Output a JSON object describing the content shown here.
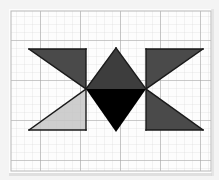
{
  "canvas": {
    "width": 219,
    "height": 180,
    "background_color": "#f7f7f7",
    "paper_color": "#fdfdfd",
    "description": "Geometric bowtie figure drawn on square grid paper"
  },
  "grid": {
    "name": "graph-paper-grid",
    "cell_size": 8,
    "major_every": 5,
    "minor_line_color": "#d8d8d8",
    "major_line_color": "#9a9a9a",
    "minor_line_width": 0.6,
    "major_line_width": 1.0,
    "origin_x": 11,
    "origin_y": 11,
    "cols": 25,
    "rows": 20,
    "border_color": "#c4c4c4"
  },
  "palette": {
    "dark_gray": "#4a4a4a",
    "light_gray": "#c6c6c6",
    "black": "#000000",
    "outline": "#1a1a1a",
    "shadow": "#2b2b2b"
  },
  "figure": {
    "name": "bowtie-star-figure",
    "outline_width": 1.4,
    "center_x": 116,
    "left_vertex_x": 86,
    "right_vertex_x": 146,
    "top_y": 49,
    "bottom_y": 130,
    "mid_y": 89,
    "apex_y": 48,
    "tip_y": 132,
    "left_outer_x": 29,
    "right_outer_x": 203,
    "shapes": [
      {
        "id": "upper-left-triangle",
        "label": "Upper left triangle",
        "fill": "#4a4a4a",
        "points": "29,49 86,49 86,89"
      },
      {
        "id": "lower-left-triangle",
        "label": "Lower left triangle",
        "fill": "#c6c6c6",
        "points": "29,130 86,130 86,89"
      },
      {
        "id": "upper-right-triangle",
        "label": "Upper right triangle",
        "fill": "#4a4a4a",
        "points": "203,49 146,49 146,89"
      },
      {
        "id": "lower-right-triangle",
        "label": "Lower right triangle",
        "fill": "#4a4a4a",
        "points": "203,130 146,130 146,89"
      },
      {
        "id": "diamond-upper-half",
        "label": "Center diamond upper half",
        "fill": "#3d3d3d",
        "points": "116,48 146,89 86,89"
      },
      {
        "id": "diamond-lower-half",
        "label": "Center diamond lower half",
        "fill": "#000000",
        "points": "86,89 146,89 116,132"
      }
    ],
    "edges": [
      {
        "id": "left-vertical-edge",
        "x1": 86,
        "y1": 49,
        "x2": 86,
        "y2": 130
      },
      {
        "id": "right-vertical-edge",
        "x1": 146,
        "y1": 49,
        "x2": 146,
        "y2": 130
      },
      {
        "id": "upper-left-top-edge",
        "x1": 29,
        "y1": 49,
        "x2": 86,
        "y2": 49
      },
      {
        "id": "upper-left-hypotenuse",
        "x1": 29,
        "y1": 49,
        "x2": 86,
        "y2": 89
      },
      {
        "id": "lower-left-bottom-edge",
        "x1": 29,
        "y1": 130,
        "x2": 86,
        "y2": 130
      },
      {
        "id": "lower-left-hypotenuse",
        "x1": 29,
        "y1": 130,
        "x2": 86,
        "y2": 89
      },
      {
        "id": "upper-right-top-edge",
        "x1": 146,
        "y1": 49,
        "x2": 203,
        "y2": 49
      },
      {
        "id": "upper-right-hypotenuse",
        "x1": 203,
        "y1": 49,
        "x2": 146,
        "y2": 89
      },
      {
        "id": "lower-right-bottom-edge",
        "x1": 146,
        "y1": 130,
        "x2": 203,
        "y2": 130
      },
      {
        "id": "lower-right-hypotenuse",
        "x1": 203,
        "y1": 130,
        "x2": 146,
        "y2": 89
      },
      {
        "id": "diamond-upper-left-edge",
        "x1": 86,
        "y1": 89,
        "x2": 116,
        "y2": 48
      },
      {
        "id": "diamond-upper-right-edge",
        "x1": 116,
        "y1": 48,
        "x2": 146,
        "y2": 89
      },
      {
        "id": "diamond-lower-left-edge",
        "x1": 86,
        "y1": 89,
        "x2": 116,
        "y2": 132
      },
      {
        "id": "diamond-lower-right-edge",
        "x1": 116,
        "y1": 132,
        "x2": 146,
        "y2": 132
      }
    ]
  },
  "artifacts": {
    "bottom_shadow_color": "#bdbdbd",
    "right_shadow_color": "#d2d2d2"
  }
}
